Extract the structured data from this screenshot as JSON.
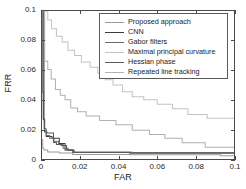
{
  "chart_data": {
    "type": "line",
    "title": "",
    "xlabel": "FAR",
    "ylabel": "FRR",
    "xlim": [
      0,
      0.1
    ],
    "ylim": [
      0,
      0.1
    ],
    "xticks": [
      "0",
      "0.02",
      "0.04",
      "0.06",
      "0.08",
      "0.1"
    ],
    "xtick_values": [
      0,
      0.02,
      0.04,
      0.06,
      0.08,
      0.1
    ],
    "yticks": [
      "0",
      "0.02",
      "0.04",
      "0.06",
      "0.08",
      "0.1"
    ],
    "ytick_values": [
      0,
      0.02,
      0.04,
      0.06,
      0.08,
      0.1
    ],
    "grid": false,
    "legend_position": "upper-right",
    "series": [
      {
        "name": "Proposed approach",
        "color": "#9a9a9a",
        "points": [
          [
            0.0,
            0.013
          ],
          [
            0.0004,
            0.013
          ],
          [
            0.0004,
            0.0075
          ],
          [
            0.001,
            0.0075
          ],
          [
            0.001,
            0.006
          ],
          [
            0.003,
            0.006
          ],
          [
            0.003,
            0.0048
          ],
          [
            0.009,
            0.0048
          ],
          [
            0.009,
            0.004
          ],
          [
            0.016,
            0.004
          ],
          [
            0.016,
            0.003
          ],
          [
            0.046,
            0.003
          ],
          [
            0.046,
            0.0028
          ],
          [
            0.093,
            0.0028
          ],
          [
            0.093,
            0.0022
          ],
          [
            0.1,
            0.0022
          ]
        ]
      },
      {
        "name": "CNN",
        "color": "#3c3c3c",
        "points": [
          [
            0.0,
            0.1
          ],
          [
            0.0005,
            0.1
          ],
          [
            0.0005,
            0.045
          ],
          [
            0.0008,
            0.045
          ],
          [
            0.0008,
            0.0265
          ],
          [
            0.0014,
            0.0265
          ],
          [
            0.0014,
            0.019
          ],
          [
            0.0022,
            0.019
          ],
          [
            0.0022,
            0.0152
          ],
          [
            0.0052,
            0.0152
          ],
          [
            0.0052,
            0.014
          ],
          [
            0.009,
            0.014
          ],
          [
            0.009,
            0.0105
          ],
          [
            0.012,
            0.0105
          ],
          [
            0.012,
            0.006
          ],
          [
            0.0165,
            0.006
          ],
          [
            0.0165,
            0.0045
          ],
          [
            0.046,
            0.0045
          ],
          [
            0.046,
            0.004
          ],
          [
            0.1,
            0.004
          ]
        ]
      },
      {
        "name": "Gabor filters",
        "color": "#6a6a6a",
        "points": [
          [
            0.0,
            0.1
          ],
          [
            0.0011,
            0.1
          ],
          [
            0.0011,
            0.0205
          ],
          [
            0.0022,
            0.0205
          ],
          [
            0.0022,
            0.0158
          ],
          [
            0.004,
            0.0158
          ],
          [
            0.004,
            0.014
          ],
          [
            0.0062,
            0.014
          ],
          [
            0.0062,
            0.012
          ],
          [
            0.0085,
            0.012
          ],
          [
            0.0085,
            0.0098
          ],
          [
            0.011,
            0.0098
          ],
          [
            0.011,
            0.0072
          ],
          [
            0.0135,
            0.0072
          ],
          [
            0.0135,
            0.0058
          ],
          [
            0.0168,
            0.0058
          ],
          [
            0.0168,
            0.0046
          ],
          [
            0.047,
            0.0046
          ],
          [
            0.047,
            0.0042
          ],
          [
            0.1,
            0.0042
          ]
        ]
      },
      {
        "name": "Maximal principal curvature",
        "color": "#c2c2c2",
        "points": [
          [
            0.0,
            0.1
          ],
          [
            0.003,
            0.1
          ],
          [
            0.003,
            0.094
          ],
          [
            0.005,
            0.094
          ],
          [
            0.005,
            0.088
          ],
          [
            0.0075,
            0.088
          ],
          [
            0.0075,
            0.083
          ],
          [
            0.0105,
            0.083
          ],
          [
            0.0105,
            0.079
          ],
          [
            0.0135,
            0.079
          ],
          [
            0.0135,
            0.0735
          ],
          [
            0.017,
            0.0735
          ],
          [
            0.017,
            0.07
          ],
          [
            0.0205,
            0.07
          ],
          [
            0.0205,
            0.0655
          ],
          [
            0.025,
            0.0655
          ],
          [
            0.025,
            0.062
          ],
          [
            0.029,
            0.062
          ],
          [
            0.029,
            0.058
          ],
          [
            0.033,
            0.058
          ],
          [
            0.033,
            0.0535
          ],
          [
            0.037,
            0.0535
          ],
          [
            0.037,
            0.05
          ],
          [
            0.042,
            0.05
          ],
          [
            0.042,
            0.0455
          ],
          [
            0.047,
            0.0455
          ],
          [
            0.047,
            0.042
          ],
          [
            0.053,
            0.042
          ],
          [
            0.053,
            0.04
          ],
          [
            0.06,
            0.04
          ],
          [
            0.06,
            0.037
          ],
          [
            0.068,
            0.037
          ],
          [
            0.068,
            0.034
          ],
          [
            0.076,
            0.034
          ],
          [
            0.076,
            0.03
          ],
          [
            0.086,
            0.03
          ],
          [
            0.086,
            0.0275
          ],
          [
            0.1,
            0.0275
          ]
        ]
      },
      {
        "name": "Hessian phase",
        "color": "#5a5a5a",
        "points": [
          [
            0.0,
            0.1
          ],
          [
            0.0006,
            0.1
          ],
          [
            0.0006,
            0.027
          ],
          [
            0.0013,
            0.027
          ],
          [
            0.0013,
            0.0182
          ],
          [
            0.0026,
            0.0182
          ],
          [
            0.0026,
            0.0176
          ],
          [
            0.006,
            0.0176
          ],
          [
            0.006,
            0.0112
          ],
          [
            0.0075,
            0.0112
          ],
          [
            0.0075,
            0.0098
          ],
          [
            0.01,
            0.0098
          ],
          [
            0.01,
            0.0092
          ],
          [
            0.0128,
            0.0092
          ],
          [
            0.0128,
            0.0062
          ],
          [
            0.016,
            0.0062
          ],
          [
            0.016,
            0.0044
          ],
          [
            0.0455,
            0.0044
          ],
          [
            0.0455,
            0.0041
          ],
          [
            0.1,
            0.0041
          ]
        ]
      },
      {
        "name": "Repeated line tracking",
        "color": "#b0b0b0",
        "points": [
          [
            0.0,
            0.1
          ],
          [
            0.0014,
            0.1
          ],
          [
            0.0014,
            0.066
          ],
          [
            0.003,
            0.066
          ],
          [
            0.003,
            0.0605
          ],
          [
            0.0048,
            0.0605
          ],
          [
            0.0048,
            0.054
          ],
          [
            0.007,
            0.054
          ],
          [
            0.007,
            0.047
          ],
          [
            0.0095,
            0.047
          ],
          [
            0.0095,
            0.043
          ],
          [
            0.012,
            0.043
          ],
          [
            0.012,
            0.04
          ],
          [
            0.015,
            0.04
          ],
          [
            0.015,
            0.0345
          ],
          [
            0.0185,
            0.0345
          ],
          [
            0.0185,
            0.032
          ],
          [
            0.023,
            0.032
          ],
          [
            0.023,
            0.029
          ],
          [
            0.03,
            0.029
          ],
          [
            0.03,
            0.026
          ],
          [
            0.0385,
            0.026
          ],
          [
            0.0385,
            0.0232
          ],
          [
            0.047,
            0.0232
          ],
          [
            0.047,
            0.0195
          ],
          [
            0.056,
            0.0195
          ],
          [
            0.056,
            0.0165
          ],
          [
            0.064,
            0.0165
          ],
          [
            0.064,
            0.014
          ],
          [
            0.073,
            0.014
          ],
          [
            0.073,
            0.011
          ],
          [
            0.085,
            0.011
          ],
          [
            0.085,
            0.008
          ],
          [
            0.1,
            0.008
          ]
        ]
      }
    ]
  },
  "legend": {
    "items": [
      {
        "label": "Proposed approach",
        "color": "#9a9a9a"
      },
      {
        "label": "CNN",
        "color": "#3c3c3c"
      },
      {
        "label": "Gabor filters",
        "color": "#6a6a6a"
      },
      {
        "label": "Maximal principal curvature",
        "color": "#c2c2c2"
      },
      {
        "label": "Hessian phase",
        "color": "#5a5a5a"
      },
      {
        "label": "Repeated line tracking",
        "color": "#b0b0b0"
      }
    ]
  },
  "axes": {
    "x_title": "FAR",
    "y_title": "FRR",
    "axis_color": "#4a4a4a"
  }
}
